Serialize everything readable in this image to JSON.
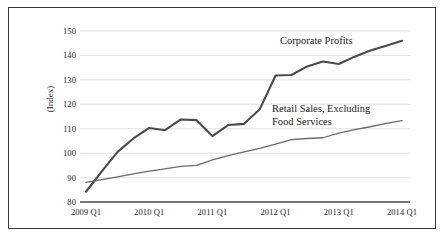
{
  "chart_data": {
    "type": "line",
    "title": "",
    "xlabel": "",
    "ylabel": "(Index)",
    "ylim": [
      80,
      150
    ],
    "yticks": [
      80,
      90,
      100,
      110,
      120,
      130,
      140,
      150
    ],
    "grid": true,
    "legend_position": "inline-annotations",
    "x": [
      "2009 Q1",
      "2009 Q2",
      "2009 Q3",
      "2009 Q4",
      "2010 Q1",
      "2010 Q2",
      "2010 Q3",
      "2010 Q4",
      "2011 Q1",
      "2011 Q2",
      "2011 Q3",
      "2011 Q4",
      "2012 Q1",
      "2012 Q2",
      "2012 Q3",
      "2012 Q4",
      "2013 Q1",
      "2013 Q2",
      "2013 Q3",
      "2013 Q4",
      "2014 Q1"
    ],
    "xticks": [
      "2009 Q1",
      "2010 Q1",
      "2011 Q1",
      "2012 Q1",
      "2013 Q1",
      "2014 Q1"
    ],
    "series": [
      {
        "name": "Corporate Profits",
        "color": "#4a4a4a",
        "width": 2.1,
        "values": [
          84.2,
          92.5,
          100.5,
          106.0,
          110.3,
          109.4,
          113.8,
          113.5,
          107.0,
          111.5,
          112.0,
          118.0,
          131.8,
          132.0,
          135.5,
          137.5,
          136.5,
          139.5,
          142.0,
          144.0,
          146.0
        ]
      },
      {
        "name": "Retail Sales, Excluding Food Services",
        "color": "#6a6a6a",
        "width": 1.3,
        "values": [
          88.0,
          89.2,
          90.3,
          91.5,
          92.6,
          93.6,
          94.6,
          95.0,
          97.2,
          99.0,
          100.5,
          102.0,
          103.7,
          105.5,
          106.0,
          106.3,
          108.2,
          109.6,
          110.8,
          112.2,
          113.3
        ]
      }
    ],
    "annotations": [
      {
        "text": "Corporate Profits",
        "series": "Corporate Profits"
      },
      {
        "text": "Retail Sales, Excluding\nFood Services",
        "series": "Retail Sales, Excluding Food Services"
      }
    ],
    "colors": {
      "gridline": "#e2e2e2",
      "axis": "#4a4a4a",
      "border": "#3a3a3a",
      "text": "#1c1c1c",
      "background": "#ffffff"
    }
  }
}
